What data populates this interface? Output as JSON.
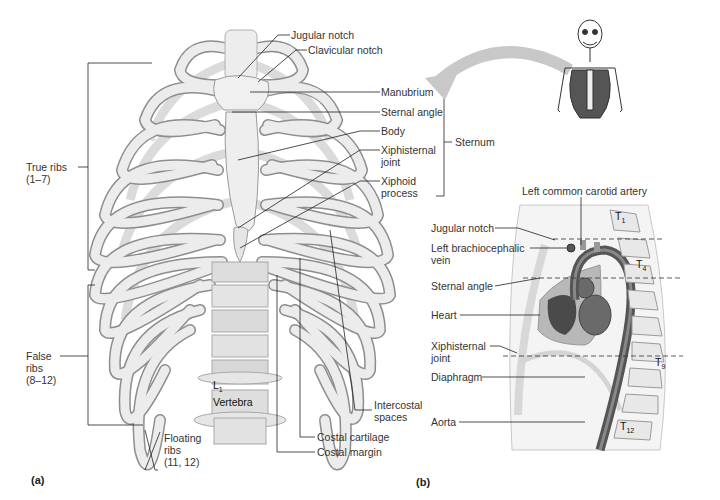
{
  "figure": {
    "panels": [
      {
        "id": "a",
        "label": "(a)",
        "view": "anterior view of thoracic cage"
      },
      {
        "id": "b",
        "label": "(b)",
        "view": "midsagittal view of thorax"
      }
    ]
  },
  "panel_a": {
    "labels": {
      "jugular_notch": "Jugular notch",
      "clavicular_notch": "Clavicular notch",
      "manubrium": "Manubrium",
      "sternal_angle": "Sternal angle",
      "body": "Body",
      "xiphisternal_joint_1": "Xiphisternal",
      "xiphisternal_joint_2": "joint",
      "xiphoid_process_1": "Xiphoid",
      "xiphoid_process_2": "process",
      "sternum": "Sternum",
      "true_ribs_1": "True ribs",
      "true_ribs_2": "(1–7)",
      "false_ribs_1": "False",
      "false_ribs_2": "ribs",
      "false_ribs_3": "(8–12)",
      "floating_ribs_1": "Floating",
      "floating_ribs_2": "ribs",
      "floating_ribs_3": "(11, 12)",
      "l1": "L",
      "l1_sub": "1",
      "vertebra": "Vertebra",
      "intercostal_1": "Intercostal",
      "intercostal_2": "spaces",
      "costal_cartilage": "Costal cartilage",
      "costal_margin": "Costal margin"
    }
  },
  "panel_b": {
    "labels": {
      "left_common_carotid": "Left common carotid artery",
      "jugular_notch": "Jugular notch",
      "left_brachiocephalic_1": "Left brachiocephalic",
      "left_brachiocephalic_2": "vein",
      "sternal_angle": "Sternal angle",
      "heart": "Heart",
      "xiphisternal_1": "Xiphisternal",
      "xiphisternal_2": "joint",
      "diaphragm": "Diaphragm",
      "aorta": "Aorta"
    },
    "vertebrae": [
      {
        "t": "T",
        "sub": "1"
      },
      {
        "t": "T",
        "sub": "4"
      },
      {
        "t": "T",
        "sub": "9"
      },
      {
        "t": "T",
        "sub": "12"
      }
    ]
  },
  "colors": {
    "bone": "#e6e6e6",
    "bone_edge": "#9a9a9a",
    "arrow": "#c8c8c8",
    "heart": "#666666",
    "aorta": "#555555",
    "line": "#222222"
  }
}
